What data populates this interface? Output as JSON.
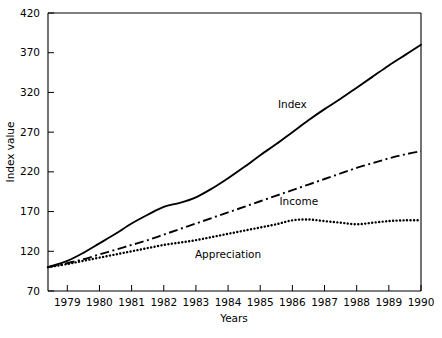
{
  "chart_data": {
    "type": "line",
    "title": "",
    "xlabel": "Years",
    "ylabel": "Index value",
    "grid": false,
    "legend_position": "inline-on-curve",
    "xlim": [
      1978.4,
      1990.0
    ],
    "ylim": [
      70,
      420
    ],
    "yticks": [
      70,
      120,
      170,
      220,
      270,
      320,
      370,
      420
    ],
    "ytick_labels": [
      "70",
      "120",
      "170",
      "220",
      "270",
      "320",
      "370",
      "420"
    ],
    "xticks": [
      1979,
      1980,
      1981,
      1982,
      1983,
      1984,
      1985,
      1986,
      1987,
      1988,
      1989,
      1990
    ],
    "xtick_labels": [
      "1979",
      "1980",
      "1981",
      "1982",
      "1983",
      "1984",
      "1985",
      "1986",
      "1987",
      "1988",
      "1989",
      "1990"
    ],
    "x": [
      1978.4,
      1979,
      1979.5,
      1980,
      1980.5,
      1981,
      1981.5,
      1982,
      1982.5,
      1983,
      1983.5,
      1984,
      1984.5,
      1985,
      1985.5,
      1986,
      1986.5,
      1987,
      1987.5,
      1988,
      1988.5,
      1989,
      1989.5,
      1990
    ],
    "series": [
      {
        "name": "Index",
        "style": "solid",
        "color": "#000000",
        "values": [
          100,
          108,
          118,
          130,
          142,
          155,
          166,
          176,
          181,
          188,
          199,
          212,
          226,
          241,
          255,
          270,
          285,
          299,
          312,
          326,
          340,
          354,
          367,
          380
        ]
      },
      {
        "name": "Income",
        "style": "dash-dot",
        "color": "#000000",
        "values": [
          100,
          105,
          110,
          116,
          122,
          128,
          134,
          141,
          148,
          155,
          162,
          169,
          176,
          183,
          190,
          197,
          204,
          211,
          218,
          225,
          231,
          237,
          242,
          246
        ]
      },
      {
        "name": "Appreciation",
        "style": "dotted",
        "color": "#000000",
        "values": [
          100,
          104,
          108,
          112,
          116,
          120,
          124,
          128,
          131,
          134,
          138,
          142,
          146,
          150,
          154,
          159,
          160,
          158,
          156,
          154,
          156,
          158,
          159,
          159
        ]
      }
    ],
    "series_labels": [
      {
        "name": "Index",
        "text": "Index",
        "x": 1986.0,
        "y": 300
      },
      {
        "name": "Income",
        "text": "Income",
        "x": 1986.2,
        "y": 178
      },
      {
        "name": "Appreciation",
        "text": "Appreciation",
        "x": 1984.0,
        "y": 112
      }
    ]
  }
}
